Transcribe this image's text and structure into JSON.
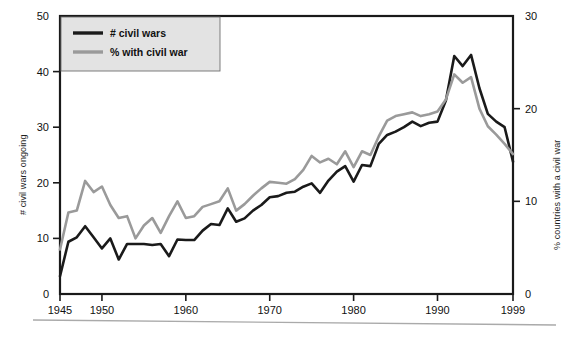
{
  "chart_data": {
    "type": "line",
    "title": "",
    "xlabel": "",
    "ylabel": "# civil wars ongoing",
    "y2label": "% countries with a civil war",
    "grid": false,
    "legend_position": "top-left",
    "xlim": [
      1945,
      1999
    ],
    "ylim": [
      0,
      50
    ],
    "y2lim": [
      0,
      30
    ],
    "xticks": [
      1945,
      1950,
      1960,
      1970,
      1980,
      1990,
      1999
    ],
    "xtick_labels": [
      "1945",
      "1950",
      "1960",
      "1970",
      "1980",
      "1990",
      "1999"
    ],
    "yticks": [
      0,
      10,
      20,
      30,
      40,
      50
    ],
    "ytick_labels": [
      "0",
      "10",
      "20",
      "30",
      "40",
      "50"
    ],
    "y2ticks": [
      0,
      10,
      20,
      30
    ],
    "y2tick_labels": [
      "0",
      "10",
      "20",
      "30"
    ],
    "x": [
      1945,
      1946,
      1947,
      1948,
      1949,
      1950,
      1951,
      1952,
      1953,
      1954,
      1955,
      1956,
      1957,
      1958,
      1959,
      1960,
      1961,
      1962,
      1963,
      1964,
      1965,
      1966,
      1967,
      1968,
      1969,
      1970,
      1971,
      1972,
      1973,
      1974,
      1975,
      1976,
      1977,
      1978,
      1979,
      1980,
      1981,
      1982,
      1983,
      1984,
      1985,
      1986,
      1987,
      1988,
      1989,
      1990,
      1991,
      1992,
      1993,
      1994,
      1995,
      1996,
      1997,
      1998,
      1999
    ],
    "series": [
      {
        "name": "# civil wars",
        "axis": "left",
        "color": "#1a1a1a",
        "width": 2.6,
        "values": [
          3.2,
          9.4,
          10.2,
          12.2,
          10.2,
          8.2,
          10.0,
          6.2,
          9.0,
          9.0,
          9.0,
          8.8,
          9.0,
          6.8,
          9.8,
          9.7,
          9.7,
          11.4,
          12.6,
          12.4,
          15.4,
          13.0,
          13.6,
          15.0,
          16.0,
          17.4,
          17.6,
          18.2,
          18.4,
          19.3,
          19.9,
          18.2,
          20.4,
          22.0,
          23.0,
          20.2,
          23.2,
          23.0,
          27.0,
          28.6,
          29.2,
          30.0,
          31.0,
          30.2,
          30.8,
          31.0,
          34.8,
          42.8,
          41.0,
          43.0,
          37.0,
          32.4,
          31.0,
          30.0,
          23.8
        ]
      },
      {
        "name": "% with civil war",
        "axis": "right",
        "color": "#9a9a9a",
        "width": 2.6,
        "values": [
          4.8,
          8.8,
          9.0,
          12.2,
          11.0,
          11.6,
          9.6,
          8.2,
          8.4,
          6.0,
          7.4,
          8.2,
          6.6,
          8.4,
          10.0,
          8.2,
          8.4,
          9.4,
          9.7,
          10.0,
          11.4,
          9.0,
          9.7,
          10.6,
          11.4,
          12.1,
          12.0,
          11.9,
          12.4,
          13.4,
          14.9,
          14.2,
          14.6,
          14.0,
          15.4,
          13.7,
          15.4,
          15.0,
          17.0,
          18.7,
          19.2,
          19.4,
          19.6,
          19.2,
          19.4,
          19.7,
          21.0,
          23.7,
          22.8,
          23.4,
          20.0,
          18.1,
          17.2,
          16.2,
          15.1
        ]
      }
    ]
  },
  "legend": {
    "items": [
      {
        "label": "# civil wars",
        "color": "#1a1a1a"
      },
      {
        "label": "% with civil war",
        "color": "#9a9a9a"
      }
    ]
  },
  "axes": {
    "left_title": "# civil wars ongoing",
    "right_title": "% countries with a civil war"
  }
}
